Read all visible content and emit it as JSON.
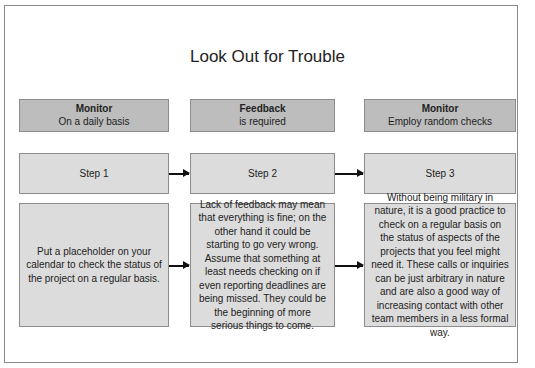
{
  "title": "Look Out for Trouble",
  "columns": [
    {
      "header": {
        "title": "Monitor",
        "subtitle": "On a daily basis"
      },
      "step": "Step 1",
      "description": "Put a placeholder on your calendar to check the status of the project on a regular basis."
    },
    {
      "header": {
        "title": "Feedback",
        "subtitle": "is required"
      },
      "step": "Step 2",
      "description": "Lack of feedback may mean that everything is fine; on the other hand it could be starting to go very wrong. Assume that something at least needs checking on if even reporting deadlines are being missed. They could be the beginning of more serious things to come."
    },
    {
      "header": {
        "title": "Monitor",
        "subtitle": "Employ random checks"
      },
      "step": "Step 3",
      "description": "Without being military in nature, it is a good practice to check on a regular basis on the status of aspects of the projects that you feel might need it. These calls or inquiries can be just arbitrary in nature and are also a good way of increasing contact with other team members in a less formal way."
    }
  ],
  "colors": {
    "header_fill": "#bdbdbd",
    "step_fill": "#dcdcdc",
    "border": "#8c8c8c",
    "arrow": "#111111"
  }
}
